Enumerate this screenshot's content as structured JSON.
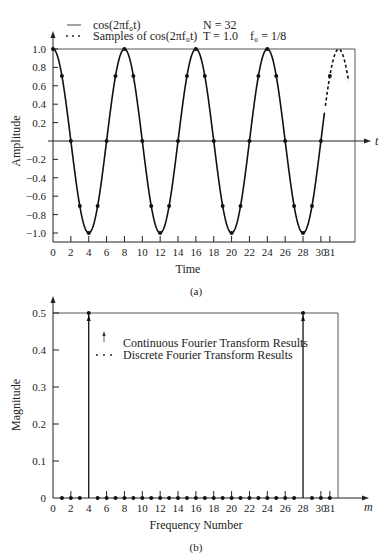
{
  "chart_data": [
    {
      "panel": "(a)",
      "type": "line",
      "caption": "(a)",
      "legend": [
        {
          "marker": "solid-line",
          "label": "cos(2πf₀t)"
        },
        {
          "marker": "dots",
          "label": "Samples of cos(2πf₀t)"
        }
      ],
      "parameters": {
        "N": "N = 32",
        "T": "T = 1.0",
        "f0": "f₀ = 1/8"
      },
      "xlabel": "Time",
      "ylabel": "Amplitude",
      "x_axis_arrow_label": "t",
      "xlim": [
        0,
        31
      ],
      "ylim": [
        -1.0,
        1.0
      ],
      "xticks": [
        0,
        2,
        4,
        6,
        8,
        10,
        12,
        14,
        16,
        18,
        20,
        22,
        24,
        26,
        28,
        30,
        31
      ],
      "yticks": [
        "1.0",
        "0.8",
        "0.6",
        "0.4",
        "0.2",
        "-0.2",
        "-0.4",
        "-0.6",
        "-0.8",
        "-1.0"
      ],
      "series": [
        {
          "name": "cos(2πf₀t)",
          "style": "solid, dashed beyond t=31",
          "function": "cos(2*pi*t/8)",
          "x": [
            0,
            1,
            2,
            3,
            4,
            5,
            6,
            7,
            8,
            9,
            10,
            11,
            12,
            13,
            14,
            15,
            16,
            17,
            18,
            19,
            20,
            21,
            22,
            23,
            24,
            25,
            26,
            27,
            28,
            29,
            30,
            31
          ],
          "values": [
            1.0,
            0.707,
            0.0,
            -0.707,
            -1.0,
            -0.707,
            0.0,
            0.707,
            1.0,
            0.707,
            0.0,
            -0.707,
            -1.0,
            -0.707,
            0.0,
            0.707,
            1.0,
            0.707,
            0.0,
            -0.707,
            -1.0,
            -0.707,
            0.0,
            0.707,
            1.0,
            0.707,
            0.0,
            -0.707,
            -1.0,
            -0.707,
            0.0,
            0.707
          ]
        },
        {
          "name": "Samples of cos(2πf₀t)",
          "style": "dots",
          "x": [
            0,
            1,
            2,
            3,
            4,
            5,
            6,
            7,
            8,
            9,
            10,
            11,
            12,
            13,
            14,
            15,
            16,
            17,
            18,
            19,
            20,
            21,
            22,
            23,
            24,
            25,
            26,
            27,
            28,
            29,
            30,
            31
          ],
          "values": [
            1.0,
            0.707,
            0.0,
            -0.707,
            -1.0,
            -0.707,
            0.0,
            0.707,
            1.0,
            0.707,
            0.0,
            -0.707,
            -1.0,
            -0.707,
            0.0,
            0.707,
            1.0,
            0.707,
            0.0,
            -0.707,
            -1.0,
            -0.707,
            0.0,
            0.707,
            1.0,
            0.707,
            0.0,
            -0.707,
            -1.0,
            -0.707,
            0.0,
            0.707
          ]
        }
      ]
    },
    {
      "panel": "(b)",
      "type": "bar",
      "caption": "(b)",
      "legend": [
        {
          "marker": "arrow",
          "label": "Continuous Fourier Transform Results"
        },
        {
          "marker": "dots",
          "label": "Discrete Fourier Transform Results"
        }
      ],
      "xlabel": "Frequency Number",
      "ylabel": "Magnitude",
      "x_axis_arrow_label": "m",
      "xlim": [
        0,
        31
      ],
      "ylim": [
        0,
        0.5
      ],
      "xticks": [
        0,
        2,
        4,
        6,
        8,
        10,
        12,
        14,
        16,
        18,
        20,
        22,
        24,
        26,
        28,
        30,
        31
      ],
      "yticks": [
        "0",
        "0.1",
        "0.2",
        "0.3",
        "0.4",
        "0.5"
      ],
      "series": [
        {
          "name": "Continuous Fourier Transform Results",
          "style": "impulse arrows",
          "x": [
            4,
            28
          ],
          "values": [
            0.5,
            0.5
          ]
        },
        {
          "name": "Discrete Fourier Transform Results",
          "style": "dots",
          "x": [
            0,
            1,
            2,
            3,
            4,
            5,
            6,
            7,
            8,
            9,
            10,
            11,
            12,
            13,
            14,
            15,
            16,
            17,
            18,
            19,
            20,
            21,
            22,
            23,
            24,
            25,
            26,
            27,
            28,
            29,
            30,
            31
          ],
          "values": [
            0,
            0,
            0,
            0,
            0.5,
            0,
            0,
            0,
            0,
            0,
            0,
            0,
            0,
            0,
            0,
            0,
            0,
            0,
            0,
            0,
            0,
            0,
            0,
            0,
            0,
            0,
            0,
            0,
            0.5,
            0,
            0,
            0
          ]
        }
      ]
    }
  ]
}
